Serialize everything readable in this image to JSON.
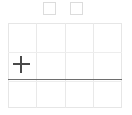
{
  "canvas": {
    "background_color": "#ffffff",
    "grid": {
      "columns": 4,
      "rows": 3,
      "line_color": "#e9e9e9",
      "border_color": "#e6e6e6",
      "column_fractions": [
        0.0,
        0.25,
        0.5,
        0.75,
        1.0
      ],
      "row_fractions": [
        0.0,
        0.34,
        0.66,
        1.0
      ]
    },
    "baseline": {
      "label": "baseline",
      "color": "#6e6e6e",
      "y_fraction": 0.655
    },
    "marker": {
      "name": "plus",
      "color": "#4a4a4a",
      "cell_column": 1,
      "cell_row": 2,
      "x_fraction": 0.115,
      "y_fraction": 0.49
    }
  },
  "toolbar": {
    "buttons": [
      {
        "name": "square-button-1",
        "label": "",
        "state": "unchecked",
        "border_color": "#dcdcdc",
        "fill_color": "#ffffff"
      },
      {
        "name": "square-button-2",
        "label": "",
        "state": "unchecked",
        "border_color": "#dcdcdc",
        "fill_color": "#ffffff"
      }
    ]
  }
}
